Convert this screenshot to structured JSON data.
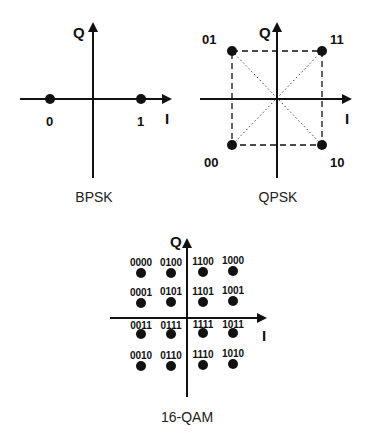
{
  "colors": {
    "ink": "#111111",
    "background": "#ffffff"
  },
  "bpsk": {
    "title": "BPSK",
    "axis_i": "I",
    "axis_q": "Q",
    "points": [
      {
        "label": "0",
        "i": -1,
        "q": 0
      },
      {
        "label": "1",
        "i": 1,
        "q": 0
      }
    ]
  },
  "qpsk": {
    "title": "QPSK",
    "axis_i": "I",
    "axis_q": "Q",
    "points": [
      {
        "label": "01",
        "i": -1,
        "q": 1
      },
      {
        "label": "11",
        "i": 1,
        "q": 1
      },
      {
        "label": "00",
        "i": -1,
        "q": -1
      },
      {
        "label": "10",
        "i": 1,
        "q": -1
      }
    ]
  },
  "qam16": {
    "title": "16-QAM",
    "axis_i": "I",
    "axis_q": "Q",
    "rows": [
      [
        "0000",
        "0100",
        "1100",
        "1000"
      ],
      [
        "0001",
        "0101",
        "1101",
        "1001"
      ],
      [
        "0011",
        "0111",
        "1111",
        "1011"
      ],
      [
        "0010",
        "0110",
        "1110",
        "1010"
      ]
    ]
  }
}
